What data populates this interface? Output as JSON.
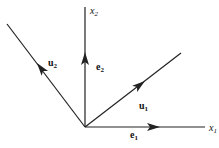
{
  "diagram": {
    "type": "basis-vectors",
    "axes": [
      {
        "name": "x1",
        "label": "x",
        "subscript": "1"
      },
      {
        "name": "x2",
        "label": "x",
        "subscript": "2"
      }
    ],
    "vectors": [
      {
        "name": "e1",
        "label": "e",
        "subscript": "1"
      },
      {
        "name": "e2",
        "label": "e",
        "subscript": "2"
      },
      {
        "name": "u1",
        "label": "u",
        "subscript": "1"
      },
      {
        "name": "u2",
        "label": "u",
        "subscript": "2"
      }
    ],
    "colors": {
      "stroke": "#222222",
      "background": "#ffffff"
    }
  }
}
